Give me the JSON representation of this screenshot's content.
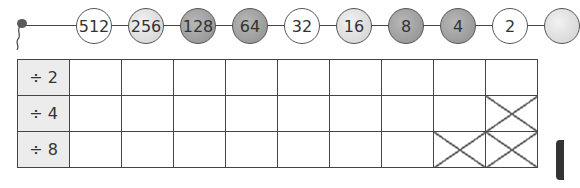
{
  "chain": {
    "beads": [
      {
        "value": "512",
        "shade": "w"
      },
      {
        "value": "256",
        "shade": "l"
      },
      {
        "value": "128",
        "shade": "d"
      },
      {
        "value": "64",
        "shade": "d"
      },
      {
        "value": "32",
        "shade": "w"
      },
      {
        "value": "16",
        "shade": "l"
      },
      {
        "value": "8",
        "shade": "d"
      },
      {
        "value": "4",
        "shade": "d"
      },
      {
        "value": "2",
        "shade": "w"
      },
      {
        "value": "",
        "shade": "l"
      }
    ]
  },
  "table": {
    "rows": [
      {
        "label": "÷ 2",
        "crossed": []
      },
      {
        "label": "÷ 4",
        "crossed": [
          8
        ]
      },
      {
        "label": "÷ 8",
        "crossed": [
          7,
          8
        ]
      }
    ],
    "columns": 9
  }
}
